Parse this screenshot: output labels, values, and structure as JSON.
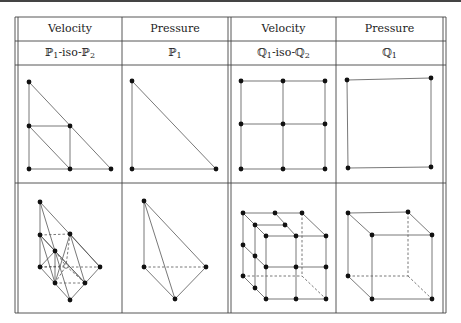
{
  "table": {
    "header": [
      {
        "label": "Velocity"
      },
      {
        "label": "Pressure"
      },
      {
        "label": "Velocity"
      },
      {
        "label": "Pressure"
      }
    ],
    "element_names": [
      {
        "base": "ℙ",
        "sub1": "1",
        "mid": "-iso-",
        "base2": "ℙ",
        "sub2": "2",
        "text": "ℙ1-iso-ℙ2"
      },
      {
        "base": "ℙ",
        "sub1": "1",
        "text": "ℙ1"
      },
      {
        "base": "ℚ",
        "sub1": "1",
        "mid": "-iso-",
        "base2": "ℚ",
        "sub2": "2",
        "text": "ℚ1-iso-ℚ2"
      },
      {
        "base": "ℚ",
        "sub1": "1",
        "text": "ℚ1"
      }
    ],
    "rows": [
      {
        "name": "2D elements",
        "cells": [
          "P1-iso-P2 triangle (6 nodes, 4 subtriangles)",
          "P1 triangle (3 nodes)",
          "Q1-iso-Q2 square (9 nodes, 4 subsquares)",
          "Q1 square (4 nodes)"
        ]
      },
      {
        "name": "3D elements",
        "cells": [
          "P1-iso-P2 tetrahedron (10 nodes)",
          "P1 tetrahedron (4 nodes)",
          "Q1-iso-Q2 hexahedron (27 nodes)",
          "Q1 hexahedron (8 nodes)"
        ]
      }
    ]
  },
  "colors": {
    "line": "#555555",
    "node": "#111111",
    "border": "#444444"
  }
}
